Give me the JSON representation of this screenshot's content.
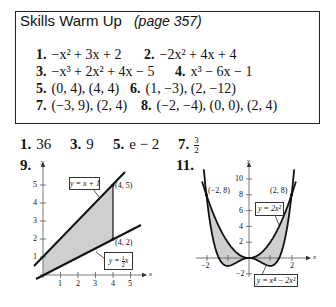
{
  "warmup": {
    "title": "Skills Warm Up",
    "page_ref": "(page 357)",
    "items": [
      {
        "num": "1.",
        "text": "−x² + 3x + 2"
      },
      {
        "num": "2.",
        "text": "−2x² + 4x + 4"
      },
      {
        "num": "3.",
        "text": "−x³ + 2x² + 4x − 5"
      },
      {
        "num": "4.",
        "text": "x³ − 6x − 1"
      },
      {
        "num": "5.",
        "text": "(0, 4), (4, 4)"
      },
      {
        "num": "6.",
        "text": "(1, −3), (2, −12)"
      },
      {
        "num": "7.",
        "text": "(−3, 9), (2, 4)"
      },
      {
        "num": "8.",
        "text": "(−2, −4), (0, 0), (2, 4)"
      }
    ]
  },
  "answers": [
    {
      "num": "1.",
      "text": "36"
    },
    {
      "num": "3.",
      "text": "9"
    },
    {
      "num": "5.",
      "text": "e − 2"
    },
    {
      "num": "7.",
      "numerator": "3",
      "denominator": "2"
    }
  ],
  "figure_labels": {
    "fig9": "9.",
    "fig11": "11."
  },
  "chart_data": [
    {
      "type": "line",
      "title": "9.",
      "xlabel": "x",
      "ylabel": "y",
      "xlim": [
        0,
        5.5
      ],
      "ylim": [
        0,
        5.5
      ],
      "xticks": [
        "1",
        "2",
        "3",
        "4",
        "5"
      ],
      "yticks": [
        "1",
        "2",
        "3",
        "4",
        "5"
      ],
      "series": [
        {
          "name": "y = x + 1",
          "x": [
            -0.5,
            5.2
          ],
          "y": [
            0.5,
            6.2
          ]
        },
        {
          "name": "y = ½x",
          "x": [
            -0.5,
            5.6
          ],
          "y": [
            -0.25,
            2.8
          ]
        }
      ],
      "shaded_region": {
        "between": [
          "y = x + 1",
          "y = ½x"
        ],
        "x_range": [
          0,
          4
        ]
      },
      "annotations": [
        "(4, 5)",
        "(4, 2)",
        "y = x + 1",
        "y = ½x"
      ],
      "grid": false
    },
    {
      "type": "line",
      "title": "11.",
      "xlabel": "x",
      "ylabel": "y",
      "xlim": [
        -2.4,
        2.6
      ],
      "ylim": [
        -3,
        11
      ],
      "xticks": [
        "−2",
        "2"
      ],
      "yticks": [
        "−2",
        "2",
        "4",
        "6",
        "8",
        "10"
      ],
      "series": [
        {
          "name": "y = 2x²",
          "x": [
            -2.2,
            -2,
            -1,
            0,
            1,
            2,
            2.2
          ],
          "y": [
            9.68,
            8,
            2,
            0,
            2,
            8,
            9.68
          ]
        },
        {
          "name": "y = x⁴ − 2x²",
          "x": [
            -2.1,
            -2,
            -1,
            0,
            1,
            2,
            2.1
          ],
          "y": [
            10.63,
            8,
            -1,
            0,
            -1,
            8,
            10.63
          ]
        }
      ],
      "shaded_region": {
        "between": [
          "y = 2x²",
          "y = x⁴ − 2x²"
        ],
        "x_range": [
          -2,
          2
        ]
      },
      "annotations": [
        "(−2, 8)",
        "(2, 8)",
        "y = 2x²",
        "y = x⁴ − 2x²"
      ],
      "grid": false
    }
  ],
  "fig9": {
    "y_axis": "y",
    "x_axis": "x",
    "xticks": [
      "1",
      "2",
      "3",
      "4",
      "5"
    ],
    "yticks": [
      "1",
      "2",
      "3",
      "4",
      "5"
    ],
    "pt_a": "(4, 5)",
    "pt_b": "(4, 2)",
    "label_a": "y = x + 1",
    "label_b_prefix": "y = ",
    "label_b_num": "1",
    "label_b_den": "2",
    "label_b_suffix": "x"
  },
  "fig11": {
    "y_axis": "y",
    "x_axis": "x",
    "xticks": [
      "−2",
      "2"
    ],
    "yticks": [
      "10",
      "8",
      "6",
      "4",
      "2",
      "−2"
    ],
    "pt_a": "(−2, 8)",
    "pt_b": "(2, 8)",
    "label_a": "y = 2x²",
    "label_b": "y = x⁴ − 2x²"
  }
}
